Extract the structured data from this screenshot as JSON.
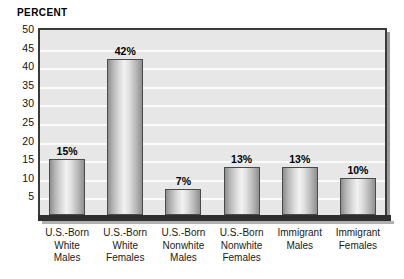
{
  "chart_data": {
    "type": "bar",
    "title": "",
    "ylabel": "PERCENT",
    "xlabel": "",
    "ylim": [
      0,
      50
    ],
    "yticks": [
      50,
      45,
      40,
      35,
      30,
      25,
      20,
      15,
      10,
      5
    ],
    "grid": true,
    "legend": false,
    "categories": [
      "U.S.-Born White Males",
      "U.S.-Born White Females",
      "U.S.-Born Nonwhite Males",
      "U.S.-Born Nonwhite Females",
      "Immigrant Males",
      "Immigrant Females"
    ],
    "category_lines": [
      [
        "U.S.-Born",
        "White",
        "Males"
      ],
      [
        "U.S.-Born",
        "White",
        "Females"
      ],
      [
        "U.S.-Born",
        "Nonwhite",
        "Males"
      ],
      [
        "U.S.-Born",
        "Nonwhite",
        "Females"
      ],
      [
        "Immigrant",
        "Males"
      ],
      [
        "Immigrant",
        "Females"
      ]
    ],
    "values": [
      15,
      42,
      7,
      13,
      13,
      10
    ],
    "data_labels": [
      "15%",
      "42%",
      "7%",
      "13%",
      "13%",
      "10%"
    ],
    "colors": {
      "plot_background": "#e7e7e7",
      "gridline": "#fbfbfb",
      "frame": "#3a3a3a",
      "bar_fill_light": "#f2f2f2",
      "bar_fill_dark": "#8e8e8e",
      "bar_border": "#4a4a4a",
      "text": "#000000",
      "page_background": "#ffffff"
    }
  }
}
